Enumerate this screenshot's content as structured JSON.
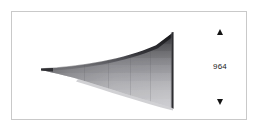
{
  "panel": {
    "background_color": "#ffffff",
    "border_color": "#c9c9c9"
  },
  "viewport": {
    "name": "horn-render-viewport",
    "background_color": "#ffffff",
    "object_label": "exponential-horn-3d-render",
    "shading": {
      "top_edge_color": "#1e1e20",
      "upper_band_color": "#5c5c60",
      "mid_band_color": "#8e8e92",
      "lower_band_color": "#b0b0b4",
      "bottom_band_color": "#c8c8cb",
      "mouth_edge_color": "#2a2a2c",
      "throat_color": "#2f2f31"
    }
  },
  "spinner": {
    "name": "value-stepper",
    "increment_label": "▲",
    "decrement_label": "▼",
    "value": "964",
    "value_color": "#1a1a1a",
    "arrow_color": "#141414"
  }
}
